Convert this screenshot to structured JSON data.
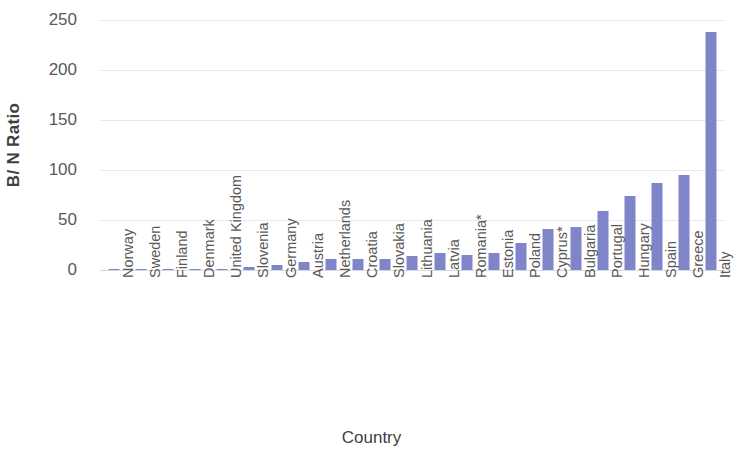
{
  "chart_data": {
    "type": "bar",
    "title": "",
    "xlabel": "Country",
    "ylabel": "B/ N Ratio",
    "ylim": [
      0,
      250
    ],
    "yticks": [
      0,
      50,
      100,
      150,
      200,
      250
    ],
    "grid": true,
    "legend": "none",
    "bar_color": "#8085c9",
    "categories": [
      "Norway",
      "Sweden",
      "Finland",
      "Denmark",
      "United Kingdom",
      "Slovenia",
      "Germany",
      "Austria",
      "Netherlands",
      "Croatia",
      "Slovakia",
      "Lithuania",
      "Latvia",
      "Romania*",
      "Estonia",
      "Poland",
      "Cyprus*",
      "Bulgaria",
      "Portugal",
      "Hungary",
      "Spain",
      "Greece",
      "Italy"
    ],
    "values": [
      1,
      1,
      1,
      1,
      1,
      3,
      5,
      8,
      11,
      11,
      11,
      14,
      17,
      15,
      17,
      27,
      41,
      43,
      59,
      74,
      87,
      95,
      238
    ]
  },
  "axes": {
    "y_title": "B/ N Ratio",
    "x_title": "Country",
    "y_tick_labels": [
      "250",
      "200",
      "150",
      "100",
      "50",
      "0"
    ]
  }
}
